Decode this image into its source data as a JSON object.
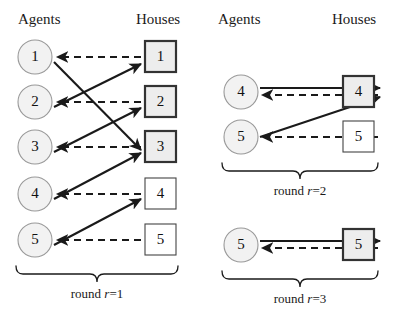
{
  "figure": {
    "agents_header": "Agents",
    "houses_header": "Houses"
  },
  "panels": [
    {
      "id": "round-1",
      "agents_header": "Agents",
      "houses_header": "Houses",
      "round_label_prefix": "round ",
      "round_label_var": "r",
      "round_label_suffix": "=1",
      "round_label_full": "round r=1",
      "agents": [
        {
          "label": "1"
        },
        {
          "label": "2"
        },
        {
          "label": "3"
        },
        {
          "label": "4"
        },
        {
          "label": "5"
        }
      ],
      "houses": [
        {
          "label": "1",
          "assigned": true
        },
        {
          "label": "2",
          "assigned": true
        },
        {
          "label": "3",
          "assigned": true
        },
        {
          "label": "4",
          "assigned": false
        },
        {
          "label": "5",
          "assigned": false
        }
      ],
      "solid_edges": [
        {
          "from_agent": 1,
          "to_house": 3
        },
        {
          "from_agent": 2,
          "to_house": 1
        },
        {
          "from_agent": 3,
          "to_house": 2
        },
        {
          "from_agent": 4,
          "to_house": 3
        },
        {
          "from_agent": 5,
          "to_house": 4
        }
      ],
      "dashed_edges": [
        {
          "from_house": 1,
          "to_agent": 1
        },
        {
          "from_house": 2,
          "to_agent": 2
        },
        {
          "from_house": 3,
          "to_agent": 3
        },
        {
          "from_house": 4,
          "to_agent": 4
        },
        {
          "from_house": 5,
          "to_agent": 5
        }
      ]
    },
    {
      "id": "round-2",
      "agents_header": "Agents",
      "houses_header": "Houses",
      "round_label_prefix": "round ",
      "round_label_var": "r",
      "round_label_suffix": "=2",
      "round_label_full": "round r=2",
      "agents": [
        {
          "label": "4"
        },
        {
          "label": "5"
        }
      ],
      "houses": [
        {
          "label": "4",
          "assigned": true
        },
        {
          "label": "5",
          "assigned": false
        }
      ],
      "solid_edges": [
        {
          "from_agent": 1,
          "to_house": 1
        },
        {
          "from_agent": 2,
          "to_house": 1
        }
      ],
      "dashed_edges": [
        {
          "from_house": 1,
          "to_agent": 1
        },
        {
          "from_house": 2,
          "to_agent": 2
        }
      ]
    },
    {
      "id": "round-3",
      "round_label_prefix": "round ",
      "round_label_var": "r",
      "round_label_suffix": "=3",
      "round_label_full": "round r=3",
      "agents": [
        {
          "label": "5"
        }
      ],
      "houses": [
        {
          "label": "5",
          "assigned": true
        }
      ],
      "solid_edges": [
        {
          "from_agent": 1,
          "to_house": 1
        }
      ],
      "dashed_edges": [
        {
          "from_house": 1,
          "to_agent": 1
        }
      ]
    }
  ]
}
